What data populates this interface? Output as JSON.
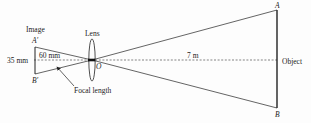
{
  "diagram": {
    "labels": {
      "image": "Image",
      "lens": "Lens",
      "object": "Object",
      "image_top": "A′",
      "image_bottom": "B′",
      "object_top": "A",
      "object_bottom": "B",
      "lens_center": "O",
      "image_height": "35 mm",
      "focal_distance": "60 mm",
      "object_distance": "7 m",
      "focal_length": "Focal length"
    },
    "colors": {
      "line": "#222222",
      "background": "#fdfdfd"
    }
  }
}
